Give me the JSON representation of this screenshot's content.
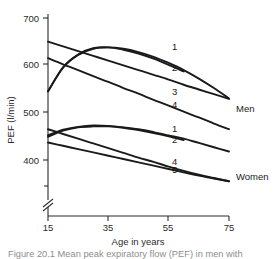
{
  "figure": {
    "caption": "Figure 20.1  Mean peak expiratory flow (PEF) in men with",
    "ylabel": "PEF (l/min)",
    "xlabel": "Age in years",
    "group_men": "Men",
    "group_women": "Women"
  },
  "axes": {
    "y_ticks": [
      "400",
      "500",
      "600",
      "700"
    ],
    "x_ticks": [
      "15",
      "35",
      "55",
      "75"
    ],
    "y_break": true
  },
  "series_labels": {
    "men_1": "1",
    "men_2": "2",
    "men_3": "3",
    "men_4": "4",
    "women_1": "1",
    "women_2": "2",
    "women_4": "4",
    "women_5": "5"
  },
  "chart_data": {
    "type": "line",
    "title": "",
    "subtitle": "",
    "xlabel": "Age in years",
    "ylabel": "PEF (l/min)",
    "xlim": [
      15,
      75
    ],
    "ylim": [
      355,
      700
    ],
    "y_ticks": [
      400,
      500,
      600,
      700
    ],
    "x_ticks": [
      15,
      35,
      55,
      75
    ],
    "y_axis_break": true,
    "grid": false,
    "legend": "inline-end-labels",
    "annotations": [
      "Men",
      "Women"
    ],
    "x": [
      15,
      20,
      25,
      30,
      35,
      40,
      45,
      50,
      55,
      60,
      65,
      70,
      75
    ],
    "series": [
      {
        "name": "1",
        "group": "Men",
        "label_position": {
          "x": 57,
          "y": 633
        },
        "values": [
          545,
          595,
          622,
          635,
          638,
          635,
          628,
          618,
          605,
          590,
          572,
          552,
          530
        ]
      },
      {
        "name": "2",
        "group": "Men",
        "label_position": {
          "x": 57,
          "y": 588
        },
        "values": [
          545,
          596,
          623,
          636,
          638,
          633,
          625,
          614,
          601,
          587,
          null,
          null,
          null
        ]
      },
      {
        "name": "3",
        "group": "Men",
        "label_position": {
          "x": 57,
          "y": 537
        },
        "values": [
          650,
          640,
          630,
          620,
          610,
          600,
          590,
          580,
          570,
          559,
          549,
          539,
          529
        ]
      },
      {
        "name": "4",
        "group": "Men",
        "label_position": {
          "x": 57,
          "y": 509
        },
        "values": [
          615,
          602,
          590,
          577,
          565,
          552,
          540,
          527,
          515,
          502,
          490,
          477,
          465
        ]
      },
      {
        "name": "1",
        "group": "Women",
        "label_position": {
          "x": 57,
          "y": 459
        },
        "values": [
          452,
          464,
          470,
          473,
          472,
          469,
          465,
          459,
          452,
          445,
          436,
          427,
          418
        ]
      },
      {
        "name": "2",
        "group": "Women",
        "label_position": {
          "x": 57,
          "y": 437
        },
        "values": [
          449,
          462,
          469,
          471,
          471,
          468,
          463,
          457,
          450,
          442,
          null,
          null,
          null
        ]
      },
      {
        "name": "4",
        "group": "Women",
        "label_position": {
          "x": 57,
          "y": 389
        },
        "values": [
          465,
          455,
          445,
          435,
          425,
          415,
          405,
          396,
          386,
          377,
          369,
          362,
          355
        ]
      },
      {
        "name": "5",
        "group": "Women",
        "label_position": {
          "x": 57,
          "y": 372
        },
        "values": [
          437,
          430,
          423,
          416,
          409,
          402,
          395,
          388,
          381,
          374,
          367,
          361,
          355
        ]
      }
    ]
  }
}
